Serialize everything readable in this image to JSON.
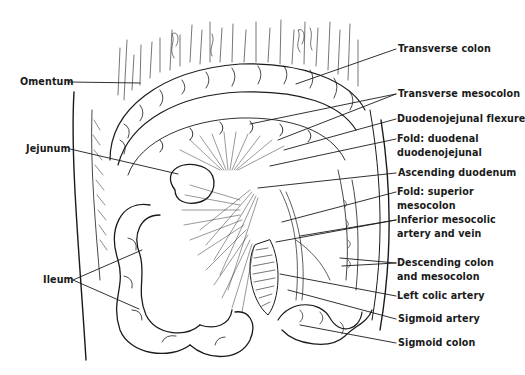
{
  "diagram": {
    "colors": {
      "ink": "#1a1a1a",
      "background": "#ffffff"
    },
    "labels_right": [
      {
        "id": "transverse-colon",
        "text": "Transverse colon",
        "x": 398,
        "y": 43
      },
      {
        "id": "transverse-mesocolon",
        "text": "Transverse mesocolon",
        "x": 398,
        "y": 88
      },
      {
        "id": "duodenojejunal-flexure",
        "text": "Duodenojejunal flexure",
        "x": 397,
        "y": 113
      },
      {
        "id": "fold-duodenal-1",
        "text": "Fold: duodenal",
        "x": 397,
        "y": 133
      },
      {
        "id": "fold-duodenal-2",
        "text": "duodenojejunal",
        "x": 397,
        "y": 147
      },
      {
        "id": "ascending-duodenum",
        "text": "Ascending duodenum",
        "x": 398,
        "y": 167
      },
      {
        "id": "fold-superior-1",
        "text": "Fold: superior",
        "x": 397,
        "y": 186
      },
      {
        "id": "fold-superior-2",
        "text": "mesocolon",
        "x": 397,
        "y": 200
      },
      {
        "id": "inferior-mesocolic-1",
        "text": "Inferior mesocolic",
        "x": 397,
        "y": 214
      },
      {
        "id": "inferior-mesocolic-2",
        "text": "artery and vein",
        "x": 397,
        "y": 228
      },
      {
        "id": "descending-colon-1",
        "text": "Descending colon",
        "x": 397,
        "y": 257
      },
      {
        "id": "descending-colon-2",
        "text": "and mesocolon",
        "x": 397,
        "y": 271
      },
      {
        "id": "left-colic-artery",
        "text": "Left colic artery",
        "x": 397,
        "y": 290
      },
      {
        "id": "sigmoid-artery",
        "text": "Sigmoid artery",
        "x": 398,
        "y": 313
      },
      {
        "id": "sigmoid-colon",
        "text": "Sigmoid colon",
        "x": 398,
        "y": 337
      }
    ],
    "labels_left": [
      {
        "id": "omentum",
        "text": "Omentum",
        "x": 20,
        "y": 76
      },
      {
        "id": "jejunum",
        "text": "Jejunum",
        "x": 26,
        "y": 143
      },
      {
        "id": "ileum",
        "text": "Ileum",
        "x": 43,
        "y": 275
      }
    ]
  }
}
